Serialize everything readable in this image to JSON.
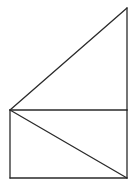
{
  "diagram": {
    "stroke_color": "#2a2a2a",
    "background": "#ffffff",
    "points": {
      "A": [
        127,
        8
      ],
      "B": [
        10,
        110
      ],
      "C": [
        127,
        110
      ],
      "D": [
        10,
        178
      ],
      "E": [
        127,
        178
      ]
    },
    "segments": [
      {
        "name": "triangle-hypotenuse",
        "from": "B",
        "to": "A"
      },
      {
        "name": "triangle-right-side",
        "from": "A",
        "to": "C"
      },
      {
        "name": "shared-horizontal-edge",
        "from": "B",
        "to": "C"
      },
      {
        "name": "rectangle-left-side",
        "from": "B",
        "to": "D"
      },
      {
        "name": "rectangle-bottom",
        "from": "D",
        "to": "E"
      },
      {
        "name": "rectangle-right-side",
        "from": "C",
        "to": "E"
      },
      {
        "name": "rectangle-diagonal",
        "from": "B",
        "to": "E"
      }
    ]
  }
}
